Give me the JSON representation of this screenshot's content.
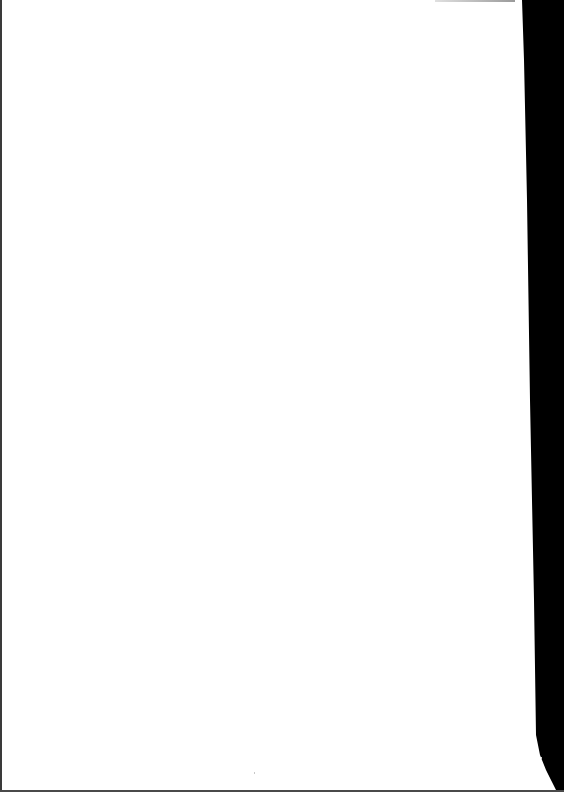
{
  "document": {
    "type": "scanned-page",
    "content": "",
    "is_blank": true
  },
  "colors": {
    "paper": "#ffffff",
    "scan_background": "#000000",
    "edge": "#3a3a3a"
  }
}
